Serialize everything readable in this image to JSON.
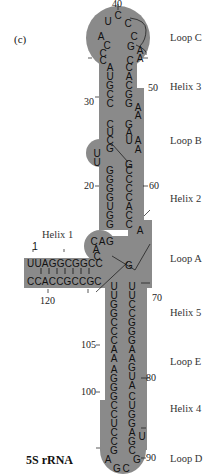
{
  "panel_label": "(c)",
  "title": "5S rRNA",
  "colors": {
    "shape_fill": "#8a8a8a",
    "text": "#111111",
    "label_text": "#333333",
    "background": "#ffffff"
  },
  "regions": [
    {
      "name": "Loop C",
      "y": 37
    },
    {
      "name": "Helix 3",
      "y": 86
    },
    {
      "name": "Loop B",
      "y": 140
    },
    {
      "name": "Helix 2",
      "y": 198
    },
    {
      "name": "Loop A",
      "y": 258
    },
    {
      "name": "Helix 5",
      "y": 312
    },
    {
      "name": "Loop E",
      "y": 361
    },
    {
      "name": "Helix 4",
      "y": 408
    },
    {
      "name": "Loop D",
      "y": 458
    }
  ],
  "position_numbers": {
    "n1": "1",
    "n20": "20",
    "n30": "30",
    "n40": "40",
    "n50": "50",
    "n60": "60",
    "n70": "70",
    "n80": "80",
    "n90": "90",
    "n100": "100",
    "n105": "105",
    "n120": "120"
  },
  "helix1": {
    "label": "Helix 1",
    "top_strand": "UUAGGCGGC",
    "bottom_strand": "CCACCGCCGC"
  },
  "loop_c": {
    "nucleotides": [
      "C",
      "U",
      "C",
      "A",
      "C",
      "C",
      "G",
      "C",
      "A",
      "A",
      "C",
      "C"
    ]
  },
  "helix3": {
    "left": [
      "A",
      "U",
      "G",
      "C",
      "C"
    ],
    "right": [
      "C",
      "A",
      "C",
      "G",
      "G"
    ]
  },
  "loop_b": {
    "left": [
      "C",
      "U",
      "C",
      "G",
      "U",
      "U"
    ],
    "right": [
      "A",
      "A",
      "G",
      "A",
      "U",
      "A",
      "A",
      "G"
    ]
  },
  "helix2": {
    "left": [
      "G",
      "G",
      "G",
      "G",
      "U",
      "G",
      "G"
    ],
    "right": [
      "C",
      "C",
      "C",
      "C",
      "A",
      "C",
      "C"
    ]
  },
  "loop_a": {
    "left": [
      "C",
      "A",
      "G",
      "A",
      "C",
      "C"
    ],
    "right": [
      "A",
      "G"
    ]
  },
  "helix5": {
    "left": [
      "U",
      "U",
      "G",
      "G",
      "C",
      "C",
      "C",
      "A"
    ],
    "right": [
      "U",
      "U",
      "C",
      "C",
      "G",
      "G",
      "G",
      "A"
    ]
  },
  "loop_e": {
    "left": [
      "A",
      "A",
      "G",
      "G"
    ],
    "right": [
      "A",
      "G",
      "U",
      "A"
    ]
  },
  "helix4": {
    "left": [
      "G",
      "C",
      "C",
      "U",
      "C",
      "C",
      "G"
    ],
    "right": [
      "C",
      "U",
      "G",
      "G",
      "A",
      "G",
      "C"
    ]
  },
  "loop_d": {
    "nucleotides": [
      "A",
      "G",
      "C",
      "G",
      "U"
    ]
  }
}
